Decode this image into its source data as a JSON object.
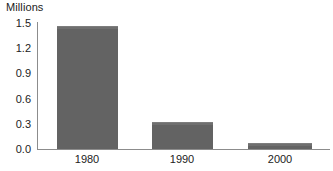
{
  "chart_data": {
    "type": "bar",
    "title": "",
    "ylabel": "Millions",
    "xlabel": "",
    "categories": [
      "1980",
      "1990",
      "2000"
    ],
    "values": [
      1.47,
      0.32,
      0.07
    ],
    "ylim": [
      0.0,
      1.5
    ],
    "yticks": [
      "0.0",
      "0.3",
      "0.6",
      "0.9",
      "1.2",
      "1.5"
    ],
    "ytick_values": [
      0.0,
      0.3,
      0.6,
      0.9,
      1.2,
      1.5
    ],
    "grid": false,
    "legend": "none",
    "series": [
      {
        "name": "Millions",
        "values": [
          1.47,
          0.32,
          0.07
        ]
      }
    ],
    "colors": {
      "bar": "#636363",
      "axis": "#8c8c8c",
      "text": "#222222",
      "background": "#ffffff"
    }
  }
}
